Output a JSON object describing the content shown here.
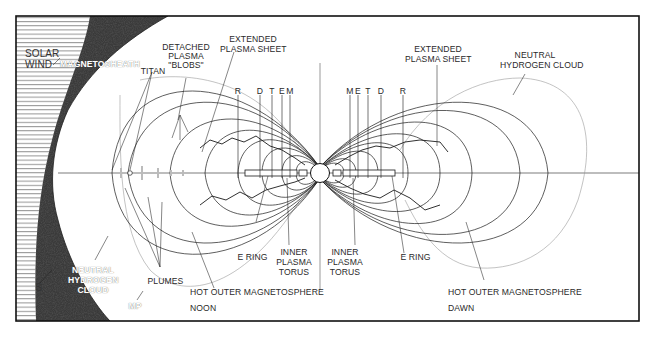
{
  "figure": {
    "colors": {
      "ink": "#1a1a1a",
      "background": "#ffffff",
      "magnetosheath": "#2b2b2b",
      "hatch": "#555555"
    }
  },
  "labels": {
    "solar_wind": [
      "SOLAR",
      "WIND"
    ],
    "magnetosheath": "MAGNETOSHEATH",
    "titan": "TITAN",
    "detached_blobs": [
      "DETACHED",
      "PLASMA",
      "\"BLOBS\""
    ],
    "extended_plasma_sheet_left": [
      "EXTENDED",
      "PLASMA SHEET"
    ],
    "extended_plasma_sheet_right": [
      "EXTENDED",
      "PLASMA SHEET"
    ],
    "neutral_hydrogen_cloud_right": [
      "NEUTRAL",
      "HYDROGEN CLOUD"
    ],
    "neutral_hydrogen_cloud_left": [
      "NEUTRAL",
      "HYDROGEN",
      "CLOUD"
    ],
    "moons_left": [
      "R",
      "D",
      "T",
      "E",
      "M"
    ],
    "moons_right": [
      "M",
      "E",
      "T",
      "D",
      "R"
    ],
    "e_ring_left": "E RING",
    "e_ring_right": "E RING",
    "inner_torus_left": [
      "INNER",
      "PLASMA",
      "TORUS"
    ],
    "inner_torus_right": [
      "INNER",
      "PLASMA",
      "TORUS"
    ],
    "plumes": "PLUMES",
    "hot_outer_left": "HOT OUTER MAGNETOSPHERE",
    "hot_outer_right": "HOT OUTER MAGNETOSPHERE",
    "noon": "NOON",
    "dawn": "DAWN",
    "shock": "S",
    "magnetopause": "MP"
  }
}
